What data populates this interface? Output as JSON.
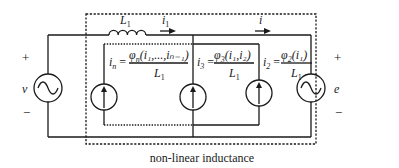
{
  "diagram": {
    "title": "non-linear inductance",
    "left_source": {
      "label": "v",
      "plus": "+",
      "minus": "−",
      "icon": "ac-voltage-source-icon"
    },
    "right_source": {
      "label": "e",
      "plus": "+",
      "minus": "−",
      "icon": "ac-voltage-source-icon"
    },
    "inductor": {
      "label": "L",
      "subscript": "1"
    },
    "currents": {
      "i1": {
        "label": "i",
        "subscript": "1"
      },
      "i": {
        "label": "i"
      }
    },
    "current_sources": [
      {
        "lhs": "i",
        "lhs_sub": "n",
        "numerator": "φ",
        "numerator_sub": "n",
        "args": "(i₁,...,iₙ₋₁)",
        "denominator": "L",
        "denominator_sub": "1"
      },
      {
        "lhs": "i",
        "lhs_sub": "3",
        "numerator": "φ",
        "numerator_sub": "3",
        "args": "(i₁,i₂)",
        "denominator": "L",
        "denominator_sub": "1"
      },
      {
        "lhs": "i",
        "lhs_sub": "2",
        "numerator": "φ",
        "numerator_sub": "2",
        "args": "(i₁)",
        "denominator": "L",
        "denominator_sub": "1"
      }
    ]
  }
}
